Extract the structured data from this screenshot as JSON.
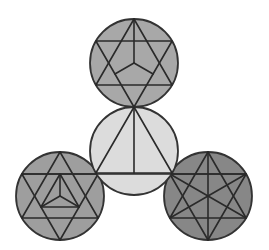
{
  "figure": {
    "title": "",
    "background": "#ffffff",
    "stroke_color": "#2a2a2a"
  },
  "circles": [
    {
      "id": "top",
      "cx": 134,
      "cy": 63,
      "r": 44,
      "fill": "#a8a8a8",
      "pattern": "hexagram-with-cube-lines"
    },
    {
      "id": "center",
      "cx": 134,
      "cy": 151,
      "r": 44,
      "fill": "#dcdcdc",
      "pattern": "triangle-with-altitude"
    },
    {
      "id": "bottom-left",
      "cx": 60,
      "cy": 196,
      "r": 44,
      "fill": "#9e9e9e",
      "pattern": "hexagram-with-inner-triangle"
    },
    {
      "id": "bottom-right",
      "cx": 208,
      "cy": 196,
      "r": 44,
      "fill": "#878787",
      "pattern": "hexagram-with-diagonals"
    }
  ]
}
